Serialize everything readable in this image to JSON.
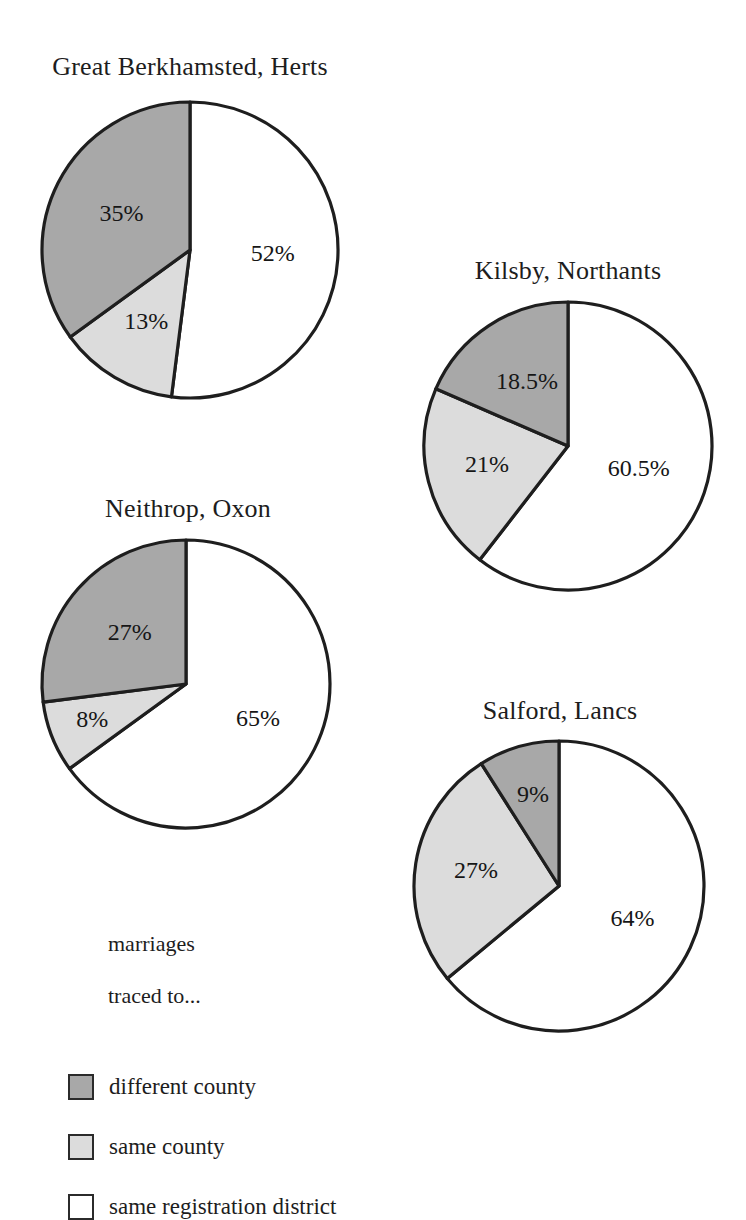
{
  "figure": {
    "kind": "pie-chart-panel",
    "panel_count": 4
  },
  "colors": {
    "different_county": "#a8a8a8",
    "same_county": "#dcdcdc",
    "same_registration_district": "#ffffff",
    "outline": "#1e1e1e",
    "text": "#1a1a1a",
    "background": "#ffffff"
  },
  "legend": {
    "heading": "marriages\ntraced to...",
    "heading_line1": "marriages",
    "heading_line2": "traced to...",
    "items": [
      {
        "label": "different county",
        "color": "#a8a8a8",
        "swatch": "filled-dark-grey-square"
      },
      {
        "label": "same county",
        "color": "#dcdcdc",
        "swatch": "filled-light-grey-square"
      },
      {
        "label": "same registration district",
        "color": "#ffffff",
        "swatch": "empty-white-square"
      }
    ]
  },
  "charts": [
    {
      "id": "great-berkhamsted",
      "title": "Great Berkhamsted, Herts",
      "labels": [
        "52%",
        "13%",
        "35%"
      ]
    },
    {
      "id": "kilsby",
      "title": "Kilsby, Northants",
      "labels": [
        "60.5%",
        "21%",
        "18.5%"
      ]
    },
    {
      "id": "neithrop",
      "title": "Neithrop, Oxon",
      "labels": [
        "65%",
        "8%",
        "27%"
      ]
    },
    {
      "id": "salford",
      "title": "Salford, Lancs",
      "labels": [
        "64%",
        "27%",
        "9%"
      ]
    }
  ],
  "chart_data": [
    {
      "type": "pie",
      "title": "Great Berkhamsted, Herts",
      "categories": [
        "same registration district",
        "same county",
        "different county"
      ],
      "values": [
        52,
        13,
        35
      ],
      "labels": [
        "52%",
        "13%",
        "35%"
      ],
      "colors": [
        "#ffffff",
        "#dcdcdc",
        "#a8a8a8"
      ],
      "start_angle_deg": 0,
      "direction": "clockwise",
      "legend_position": "bottom-left-of-figure"
    },
    {
      "type": "pie",
      "title": "Kilsby, Northants",
      "categories": [
        "same registration district",
        "same county",
        "different county"
      ],
      "values": [
        60.5,
        21,
        18.5
      ],
      "labels": [
        "60.5%",
        "21%",
        "18.5%"
      ],
      "colors": [
        "#ffffff",
        "#dcdcdc",
        "#a8a8a8"
      ],
      "start_angle_deg": 0,
      "direction": "clockwise",
      "legend_position": "bottom-left-of-figure"
    },
    {
      "type": "pie",
      "title": "Neithrop, Oxon",
      "categories": [
        "same registration district",
        "same county",
        "different county"
      ],
      "values": [
        65,
        8,
        27
      ],
      "labels": [
        "65%",
        "8%",
        "27%"
      ],
      "colors": [
        "#ffffff",
        "#dcdcdc",
        "#a8a8a8"
      ],
      "start_angle_deg": 0,
      "direction": "clockwise",
      "legend_position": "bottom-left-of-figure"
    },
    {
      "type": "pie",
      "title": "Salford, Lancs",
      "categories": [
        "same registration district",
        "same county",
        "different county"
      ],
      "values": [
        64,
        27,
        9
      ],
      "labels": [
        "64%",
        "27%",
        "9%"
      ],
      "colors": [
        "#ffffff",
        "#dcdcdc",
        "#a8a8a8"
      ],
      "start_angle_deg": 0,
      "direction": "clockwise",
      "legend_position": "bottom-left-of-figure"
    }
  ]
}
